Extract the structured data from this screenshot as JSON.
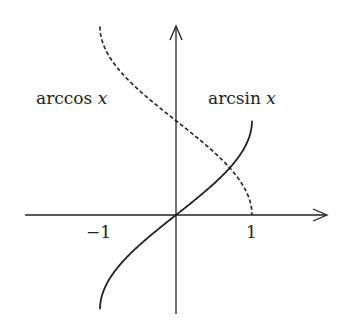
{
  "chart_data": {
    "type": "line",
    "title": "",
    "xlabel": "",
    "ylabel": "",
    "xlim": [
      -2.0,
      2.0
    ],
    "ylim": [
      -1.6,
      3.15
    ],
    "grid": false,
    "legend": "inline labels",
    "x_tick_labels": [
      "−1",
      "1"
    ],
    "x_ticks": [
      -1,
      1
    ],
    "series": [
      {
        "name": "arcsin x",
        "style": "solid",
        "x": [
          -1,
          -0.9,
          -0.75,
          -0.5,
          -0.25,
          0,
          0.25,
          0.5,
          0.75,
          0.9,
          1
        ],
        "y": [
          -1.571,
          -1.12,
          -0.848,
          -0.524,
          -0.253,
          0,
          0.253,
          0.524,
          0.848,
          1.12,
          1.571
        ]
      },
      {
        "name": "arccos x",
        "style": "dashed",
        "x": [
          -1,
          -0.9,
          -0.75,
          -0.5,
          -0.25,
          0,
          0.25,
          0.5,
          0.75,
          0.9,
          1
        ],
        "y": [
          3.142,
          2.691,
          2.419,
          2.094,
          1.823,
          1.571,
          1.318,
          1.047,
          0.723,
          0.451,
          0
        ]
      }
    ]
  },
  "labels": {
    "arccos_fn": "arccos",
    "arcsin_fn": "arcsin",
    "var": "x",
    "tick_neg1": "−1",
    "tick_pos1": "1"
  }
}
